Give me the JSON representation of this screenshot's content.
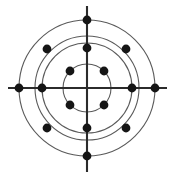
{
  "figure": {
    "name": "concentric-circle-point-lattice",
    "background_color": "#ffffff",
    "width": 172,
    "height": 179
  },
  "chart_data": {
    "type": "scatter",
    "title": "",
    "subtitle": "",
    "xlabel": "",
    "ylabel": "",
    "coordinate_system": "polar",
    "grid": true,
    "legend": false,
    "legend_position": "none",
    "center": {
      "x": 87,
      "y": 88
    },
    "xlim": [
      0,
      172
    ],
    "ylim": [
      0,
      179
    ],
    "axes": {
      "stroke": "#2b2b2b",
      "stroke_width": 2.1,
      "horizontal": {
        "x1": 8,
        "y1": 88,
        "x2": 167,
        "y2": 88
      },
      "vertical": {
        "x1": 87,
        "y1": 6,
        "x2": 87,
        "y2": 172
      }
    },
    "rings": [
      {
        "index": 1,
        "radius": 24,
        "stroke": "#5a5a5a",
        "stroke_width": 1.1
      },
      {
        "index": 2,
        "radius": 45,
        "stroke": "#5a5a5a",
        "stroke_width": 1.1
      },
      {
        "index": 3,
        "radius": 52,
        "stroke": "#5a5a5a",
        "stroke_width": 1.1
      },
      {
        "index": 4,
        "radius": 68,
        "stroke": "#5a5a5a",
        "stroke_width": 1.1
      }
    ],
    "point_style": {
      "fill": "#151515",
      "radius": 4.4,
      "count": 16
    },
    "points": [
      {
        "id": "p1",
        "ring": 1,
        "angle_deg": 45,
        "r": 24,
        "x": 104,
        "y": 71
      },
      {
        "id": "p2",
        "ring": 1,
        "angle_deg": 135,
        "r": 24,
        "x": 70,
        "y": 71
      },
      {
        "id": "p3",
        "ring": 1,
        "angle_deg": 225,
        "r": 24,
        "x": 70,
        "y": 105
      },
      {
        "id": "p4",
        "ring": 1,
        "angle_deg": 315,
        "r": 24,
        "x": 104,
        "y": 105
      },
      {
        "id": "p5",
        "ring": 2,
        "angle_deg": 0,
        "r": 45,
        "x": 132,
        "y": 88
      },
      {
        "id": "p6",
        "ring": 2,
        "angle_deg": 90,
        "r": 45,
        "x": 87,
        "y": 48
      },
      {
        "id": "p7",
        "ring": 2,
        "angle_deg": 180,
        "r": 45,
        "x": 42,
        "y": 88
      },
      {
        "id": "p8",
        "ring": 2,
        "angle_deg": 270,
        "r": 45,
        "x": 87,
        "y": 128
      },
      {
        "id": "p9",
        "ring": 3,
        "angle_deg": 45,
        "r": 52,
        "x": 126,
        "y": 49
      },
      {
        "id": "p10",
        "ring": 3,
        "angle_deg": 135,
        "r": 52,
        "x": 47,
        "y": 49
      },
      {
        "id": "p11",
        "ring": 3,
        "angle_deg": 225,
        "r": 52,
        "x": 47,
        "y": 128
      },
      {
        "id": "p12",
        "ring": 3,
        "angle_deg": 315,
        "r": 52,
        "x": 126,
        "y": 128
      },
      {
        "id": "p13",
        "ring": 4,
        "angle_deg": 0,
        "r": 68,
        "x": 155,
        "y": 88
      },
      {
        "id": "p14",
        "ring": 4,
        "angle_deg": 90,
        "r": 68,
        "x": 87,
        "y": 20
      },
      {
        "id": "p15",
        "ring": 4,
        "angle_deg": 180,
        "r": 68,
        "x": 19,
        "y": 88
      },
      {
        "id": "p16",
        "ring": 4,
        "angle_deg": 270,
        "r": 68,
        "x": 87,
        "y": 156
      }
    ]
  }
}
